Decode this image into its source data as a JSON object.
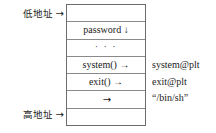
{
  "diagram": {
    "left_labels": [
      {
        "name": "low-address",
        "text": "低地址",
        "arrow": "→"
      },
      {
        "name": "high-address",
        "text": "高地址",
        "arrow": "→"
      }
    ],
    "stack_rows": [
      {
        "name": "row-top-empty",
        "text": ""
      },
      {
        "name": "row-password",
        "text": "password ↓"
      },
      {
        "name": "row-ellipsis",
        "text": "· · ·"
      },
      {
        "name": "row-system-call",
        "text": "system() →"
      },
      {
        "name": "row-exit-call",
        "text": "exit() →"
      },
      {
        "name": "row-arg-arrow",
        "text": "→"
      },
      {
        "name": "row-bottom-empty",
        "text": ""
      }
    ],
    "annotations": [
      {
        "name": "system-plt",
        "text": "system@plt"
      },
      {
        "name": "exit-plt",
        "text": "exit@plt"
      },
      {
        "name": "bin-sh",
        "text": "“/bin/sh”"
      }
    ],
    "colors": {
      "background": "#ffffff",
      "text": "#1a1a1a",
      "box_border": "#6b6b6b",
      "row_divider": "#8a8a8a"
    }
  }
}
